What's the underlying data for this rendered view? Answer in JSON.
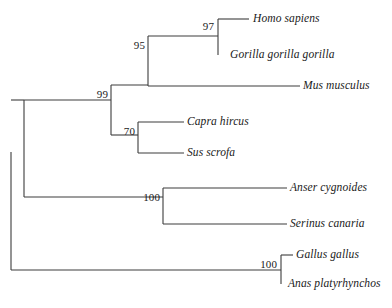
{
  "figure": {
    "type": "phylogenetic-tree",
    "orientation": "left-to-right-rectangular",
    "stroke_color": "#3c3c3c",
    "text_color": "#1a1a1a",
    "background": "#ffffff"
  },
  "taxa": [
    {
      "id": "homo-sapiens",
      "label": "Homo sapiens",
      "x": 253,
      "y": 19
    },
    {
      "id": "gorilla",
      "label": "Gorilla gorilla gorilla",
      "x": 230,
      "y": 55
    },
    {
      "id": "mus-musculus",
      "label": "Mus musculus",
      "x": 303,
      "y": 86
    },
    {
      "id": "capra-hircus",
      "label": "Capra hircus",
      "x": 187,
      "y": 122
    },
    {
      "id": "sus-scrofa",
      "label": "Sus scrofa",
      "x": 187,
      "y": 153
    },
    {
      "id": "anser-cygnoides",
      "label": "Anser cygnoides",
      "x": 290,
      "y": 188
    },
    {
      "id": "serinus-canaria",
      "label": "Serinus canaria",
      "x": 290,
      "y": 224
    },
    {
      "id": "gallus-gallus",
      "label": "Gallus gallus",
      "x": 296,
      "y": 255
    },
    {
      "id": "anas-platyrhynchos",
      "label": "Anas platyrhynchos",
      "x": 288,
      "y": 284
    }
  ],
  "support_values": [
    {
      "id": "node-97",
      "label": "97",
      "x": 214,
      "y": 26
    },
    {
      "id": "node-95",
      "label": "95",
      "x": 145,
      "y": 45
    },
    {
      "id": "node-99",
      "label": "99",
      "x": 108,
      "y": 94
    },
    {
      "id": "node-70",
      "label": "70",
      "x": 135,
      "y": 131
    },
    {
      "id": "node-100-birds",
      "label": "100",
      "x": 160,
      "y": 197
    },
    {
      "id": "node-100-fowl",
      "label": "100",
      "x": 277,
      "y": 264
    }
  ],
  "branches": {
    "vertical_connectors": [
      {
        "id": "root-connector",
        "x": 11,
        "y1": 152,
        "y2": 270
      },
      {
        "id": "amniote-connector",
        "x": 24,
        "y1": 100,
        "y2": 197
      },
      {
        "id": "mammal-connector",
        "x": 111,
        "y1": 85,
        "y2": 135
      },
      {
        "id": "primate-rodent-connector",
        "x": 148,
        "y1": 36,
        "y2": 86
      },
      {
        "id": "hominid-connector",
        "x": 218,
        "y1": 19,
        "y2": 55
      },
      {
        "id": "artiodactyl-connector",
        "x": 138,
        "y1": 122,
        "y2": 153
      },
      {
        "id": "bird-connector",
        "x": 163,
        "y1": 188,
        "y2": 224
      },
      {
        "id": "fowl-connector",
        "x": 281,
        "y1": 255,
        "y2": 284
      }
    ],
    "horizontal_branches": [
      {
        "id": "branch-root-amniote",
        "y": 100,
        "x1": 11,
        "x2": 24
      },
      {
        "id": "branch-root-fowl",
        "y": 270,
        "x1": 11,
        "x2": 281
      },
      {
        "id": "branch-amniote-mammal",
        "y": 100,
        "x1": 24,
        "x2": 111
      },
      {
        "id": "branch-amniote-bird",
        "y": 197,
        "x1": 24,
        "x2": 163
      },
      {
        "id": "branch-mammal-upper",
        "y": 85,
        "x1": 111,
        "x2": 148
      },
      {
        "id": "branch-mammal-lower",
        "y": 135,
        "x1": 111,
        "x2": 138
      },
      {
        "id": "branch-hominid",
        "y": 36,
        "x1": 148,
        "x2": 218
      },
      {
        "id": "branch-mus-musculus",
        "y": 86,
        "x1": 148,
        "x2": 300
      },
      {
        "id": "branch-homo-sapiens",
        "y": 19,
        "x1": 218,
        "x2": 249
      },
      {
        "id": "branch-capra-hircus",
        "y": 122,
        "x1": 138,
        "x2": 184
      },
      {
        "id": "branch-sus-scrofa",
        "y": 153,
        "x1": 138,
        "x2": 184
      },
      {
        "id": "branch-anser",
        "y": 188,
        "x1": 163,
        "x2": 287
      },
      {
        "id": "branch-serinus",
        "y": 224,
        "x1": 163,
        "x2": 287
      },
      {
        "id": "branch-gallus",
        "y": 255,
        "x1": 281,
        "x2": 293
      }
    ]
  }
}
